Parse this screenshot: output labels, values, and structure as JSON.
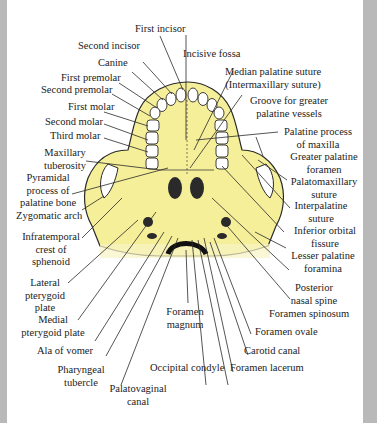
{
  "diagram": {
    "colors": {
      "bone": "#f5ef9a",
      "ink": "#2a2a2a",
      "frame": "#b9b9b9",
      "background": "#ffffff"
    },
    "labels": {
      "first_incisor": "First incisor",
      "second_incisor": "Second  incisor",
      "canine": "Canine",
      "first_premolar": "First premolar",
      "second_premolar": "Second premolar",
      "first_molar": "First molar",
      "second_molar": "Second molar",
      "third_molar": "Third molar",
      "maxillary_tuberosity_1": "Maxillary",
      "maxillary_tuberosity_2": "tuberosity",
      "pyramidal_1": "Pyramidal",
      "pyramidal_2": "process of",
      "pyramidal_3": "palatine bone",
      "zygomatic_arch": "Zygomatic arch",
      "infratemporal_1": "Infratemporal",
      "infratemporal_2": "crest of",
      "infratemporal_3": "sphenoid",
      "lateral_pterygoid_1": "Lateral",
      "lateral_pterygoid_2": "pterygoid",
      "lateral_pterygoid_3": "plate",
      "medial_pterygoid_1": "Medial",
      "medial_pterygoid_2": "pterygoid plate",
      "ala_of_vomer": "Ala of vomer",
      "pharyngeal_tubercle_1": "Pharyngeal",
      "pharyngeal_tubercle_2": "tubercle",
      "palatovaginal_1": "Palatovaginal",
      "palatovaginal_2": "canal",
      "incisive_fossa": "Incisive fossa",
      "median_palatine_1": "Median palatine suture",
      "median_palatine_2": "(Intermaxillary suture)",
      "groove_1": "Groove for greater",
      "groove_2": "palatine vessels",
      "palatine_process_1": "Palatine process",
      "palatine_process_2": "of maxilla",
      "greater_palatine_1": "Greater palatine",
      "greater_palatine_2": "foramen",
      "palatomaxillary_1": "Palatomaxillary",
      "palatomaxillary_2": "suture",
      "interpalatine_1": "Interpalatine",
      "interpalatine_2": "suture",
      "inferior_orbital_1": "Inferior orbital",
      "inferior_orbital_2": "fissure",
      "lesser_palatine_1": "Lesser palatine",
      "lesser_palatine_2": "foramina",
      "posterior_nasal_1": "Posterior",
      "posterior_nasal_2": "nasal spine",
      "foramen_spinosum": "Foramen spinosum",
      "foramen_ovale": "Foramen ovale",
      "carotid_canal": "Carotid canal",
      "foramen_lacerum": "Foramen lacerum",
      "occipital_condyle": "Occipital condyle",
      "foramen_magnum_1": "Foramen",
      "foramen_magnum_2": "magnum"
    }
  }
}
